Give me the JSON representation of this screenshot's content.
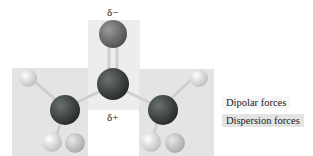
{
  "diagram": {
    "molecule": "acetone (ball-and-stick)",
    "charges": {
      "top": "δ−",
      "bottom": "δ+"
    },
    "legend": [
      {
        "label": "Dipolar forces",
        "color": "#f6f6f6"
      },
      {
        "label": "Dispersion forces",
        "color": "#e4e4e4"
      }
    ],
    "colors": {
      "carbon": "#3a3f3e",
      "oxygen": "#6b6b6b",
      "hydrogen": "#eeeeee",
      "bond": "#c8c8c8",
      "dipolar_region": "#ededed",
      "dispersion_region": "#e4e4e4"
    }
  }
}
